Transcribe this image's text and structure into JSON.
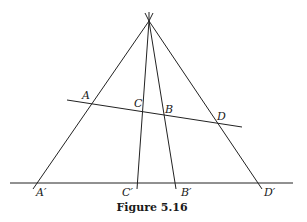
{
  "figure": {
    "caption": "Figure 5.16",
    "apex": {
      "x": 149,
      "y": 21
    },
    "transversal": {
      "x1": 67,
      "y1": 100,
      "x2": 242,
      "y2": 127
    },
    "baseline": {
      "x1": 10,
      "y1": 183,
      "x2": 293,
      "y2": 183
    },
    "rays": [
      {
        "name": "ray-a",
        "x2": 33,
        "y2": 189
      },
      {
        "name": "ray-c",
        "x2": 137,
        "y2": 189
      },
      {
        "name": "ray-b",
        "x2": 176,
        "y2": 189
      },
      {
        "name": "ray-d",
        "x2": 262,
        "y2": 189
      }
    ],
    "points": {
      "A": {
        "label": "A",
        "x": 82,
        "y": 99
      },
      "C": {
        "label": "C",
        "x": 134,
        "y": 107
      },
      "B": {
        "label": "B",
        "x": 165,
        "y": 113
      },
      "D": {
        "label": "D",
        "x": 217,
        "y": 120
      },
      "A_prime": {
        "label": "A′",
        "x": 36,
        "y": 196
      },
      "C_prime": {
        "label": "C′",
        "x": 122,
        "y": 196
      },
      "B_prime": {
        "label": "B′",
        "x": 181,
        "y": 196
      },
      "D_prime": {
        "label": "D′",
        "x": 264,
        "y": 196
      }
    }
  }
}
